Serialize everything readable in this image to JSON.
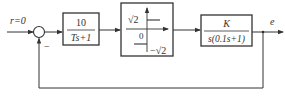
{
  "diagram": {
    "type": "block-diagram",
    "input": {
      "label": "r=0"
    },
    "summing_junction": {
      "feedback_sign": "−"
    },
    "blocks": [
      {
        "id": "first-order",
        "numerator": "10",
        "denominator": "Ts+1"
      },
      {
        "id": "relay",
        "upper_level": "√2",
        "lower_level": "−√2",
        "origin": "0"
      },
      {
        "id": "plant",
        "numerator": "K",
        "denominator": "s(0.1s+1)"
      }
    ],
    "output": {
      "label": "e"
    },
    "colors": {
      "stroke": "#333333",
      "background": "#ffffff"
    }
  }
}
